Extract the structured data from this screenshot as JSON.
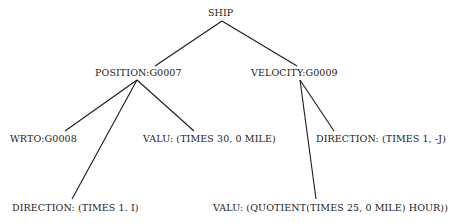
{
  "diagram": {
    "type": "tree",
    "nodes": {
      "root": {
        "label": "SHIP"
      },
      "position": {
        "label": "POSITION:G0007"
      },
      "velocity": {
        "label": "VELOCITY:G0009"
      },
      "wrto": {
        "label": "WRTO:G0008"
      },
      "position_valu": {
        "label": "VALU: (TIMES 30, 0 MILE)"
      },
      "velocity_direction": {
        "label": "DIRECTION: (TIMES 1, -J)"
      },
      "position_direction": {
        "label": "DIRECTION: (TIMES 1. I)"
      },
      "velocity_valu": {
        "label": "VALU: (QUOTIENT(TIMES 25, 0 MILE) HOUR))"
      }
    },
    "edges": [
      {
        "from": "SHIP",
        "to": "POSITION:G0007"
      },
      {
        "from": "SHIP",
        "to": "VELOCITY:G0009"
      },
      {
        "from": "POSITION:G0007",
        "to": "WRTO:G0008"
      },
      {
        "from": "POSITION:G0007",
        "to": "DIRECTION: (TIMES 1. I)"
      },
      {
        "from": "POSITION:G0007",
        "to": "VALU: (TIMES 30, 0 MILE)"
      },
      {
        "from": "VELOCITY:G0009",
        "to": "VALU: (QUOTIENT(TIMES 25, 0 MILE) HOUR))"
      },
      {
        "from": "VELOCITY:G0009",
        "to": "DIRECTION: (TIMES 1, -J)"
      }
    ],
    "colors": {
      "ink": "#1a1a1a",
      "background": "#ffffff"
    }
  }
}
